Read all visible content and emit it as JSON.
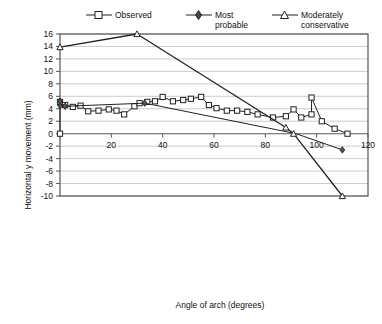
{
  "chart_data": {
    "type": "line",
    "title": "",
    "xlabel": "Angle of arch (degrees)",
    "ylabel": "Horizontal y movement (mm)",
    "xlim": [
      0,
      120
    ],
    "ylim": [
      -10,
      16
    ],
    "xticks": [
      0,
      20,
      40,
      60,
      80,
      100,
      120
    ],
    "xtick_labels": [
      "",
      "20",
      "40",
      "60",
      "80",
      "100",
      "120"
    ],
    "yticks": [
      -10,
      -8,
      -6,
      -4,
      -2,
      0,
      2,
      4,
      6,
      8,
      10,
      12,
      14,
      16
    ],
    "ytick_labels": [
      "-10",
      "-8",
      "-6",
      "-4",
      "-2",
      "0",
      "2",
      "4",
      "6",
      "8",
      "10",
      "12",
      "14",
      "16"
    ],
    "grid": "horizontal",
    "legend_position": "top",
    "series": [
      {
        "name": "Observed",
        "marker": "square",
        "points": [
          [
            0,
            0.0
          ],
          [
            0,
            5.1
          ],
          [
            2,
            4.6
          ],
          [
            5,
            4.3
          ],
          [
            8,
            4.5
          ],
          [
            11,
            3.6
          ],
          [
            15,
            3.7
          ],
          [
            19,
            3.9
          ],
          [
            22,
            3.7
          ],
          [
            25,
            3.1
          ],
          [
            29,
            4.4
          ],
          [
            31,
            4.9
          ],
          [
            34,
            5.1
          ],
          [
            37,
            5.2
          ],
          [
            40,
            5.9
          ],
          [
            44,
            5.2
          ],
          [
            48,
            5.4
          ],
          [
            51,
            5.6
          ],
          [
            55,
            5.9
          ],
          [
            58,
            4.6
          ],
          [
            61,
            4.1
          ],
          [
            65,
            3.7
          ],
          [
            69,
            3.7
          ],
          [
            73,
            3.5
          ],
          [
            77,
            3.1
          ],
          [
            83,
            2.6
          ],
          [
            88,
            2.8
          ],
          [
            91,
            3.9
          ],
          [
            94,
            2.6
          ],
          [
            98,
            3.1
          ],
          [
            98,
            5.8
          ],
          [
            102,
            2.0
          ],
          [
            107,
            0.8
          ],
          [
            112,
            0.0
          ]
        ]
      },
      {
        "name": "Most probable",
        "marker": "diamond",
        "points": [
          [
            0,
            4.5
          ],
          [
            0,
            5.2
          ],
          [
            2,
            4.4
          ],
          [
            33,
            4.9
          ],
          [
            92,
            0.0
          ],
          [
            110,
            -2.6
          ]
        ]
      },
      {
        "name": "Moderately conservative",
        "marker": "triangle",
        "points": [
          [
            0,
            13.9
          ],
          [
            30,
            16.0
          ],
          [
            88,
            1.0
          ],
          [
            91,
            0.0
          ],
          [
            110,
            -10.0
          ]
        ]
      }
    ]
  },
  "legend": {
    "items": [
      {
        "label": "Observed",
        "marker": "square"
      },
      {
        "label": "Most\nprobable",
        "marker": "diamond"
      },
      {
        "label": "Moderately\nconservative",
        "marker": "triangle"
      }
    ]
  },
  "colors": {
    "line": "#222222",
    "grid": "#bfbfbf",
    "frame": "#555555",
    "background": "#ffffff",
    "text": "#111111"
  }
}
